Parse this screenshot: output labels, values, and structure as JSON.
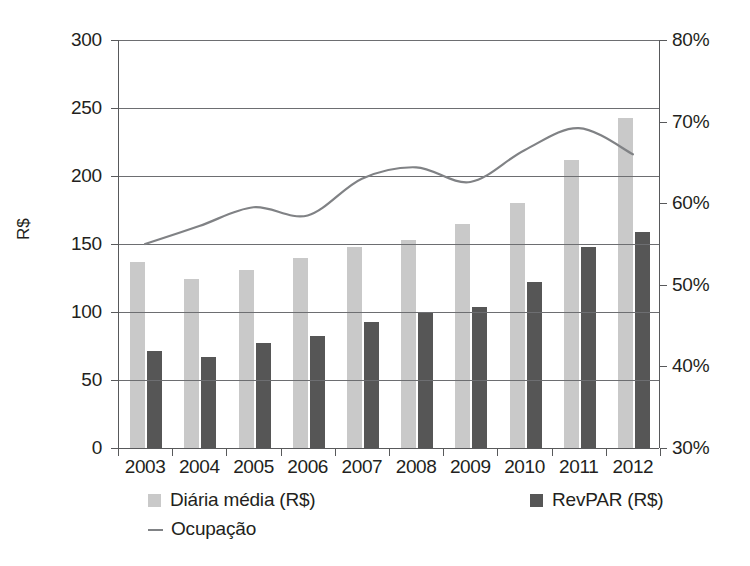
{
  "chart_data": {
    "type": "bar",
    "title": "",
    "subtitle": "",
    "xlabel": "",
    "ylabel": "R$",
    "ylabel_secondary": "",
    "categories": [
      "2003",
      "2004",
      "2005",
      "2006",
      "2007",
      "2008",
      "2009",
      "2010",
      "2011",
      "2012"
    ],
    "series": [
      {
        "name": "Diária média (R$)",
        "type": "bar",
        "axis": "left",
        "color": "#c9c9c9",
        "values": [
          137,
          124,
          131,
          140,
          148,
          153,
          165,
          180,
          212,
          243
        ]
      },
      {
        "name": "RevPAR (R$)",
        "type": "bar",
        "axis": "left",
        "color": "#565656",
        "values": [
          71,
          67,
          77,
          82,
          93,
          100,
          104,
          122,
          148,
          159
        ]
      },
      {
        "name": "Ocupação",
        "type": "line",
        "axis": "right",
        "color": "#808285",
        "values": [
          55.0,
          57.2,
          59.5,
          58.5,
          63.0,
          64.4,
          62.6,
          66.5,
          69.2,
          66.0
        ]
      }
    ],
    "ylim": [
      0,
      300
    ],
    "yticks": [
      0,
      50,
      100,
      150,
      200,
      250,
      300
    ],
    "ylim_secondary": [
      30,
      80
    ],
    "yticks_secondary": [
      30,
      40,
      50,
      60,
      70,
      80
    ],
    "grid": true,
    "legend_position": "bottom"
  },
  "axes": {
    "left_label": "R$",
    "left_ticks": [
      "0",
      "50",
      "100",
      "150",
      "200",
      "250",
      "300"
    ],
    "right_ticks": [
      "30%",
      "40%",
      "50%",
      "60%",
      "70%",
      "80%"
    ],
    "x_ticks": [
      "2003",
      "2004",
      "2005",
      "2006",
      "2007",
      "2008",
      "2009",
      "2010",
      "2011",
      "2012"
    ]
  },
  "legend": {
    "items": [
      {
        "label": "Diária média (R$)",
        "marker": "square-swatch",
        "color": "#c9c9c9"
      },
      {
        "label": "RevPAR (R$)",
        "marker": "square-swatch",
        "color": "#565656"
      },
      {
        "label": "Ocupação",
        "marker": "line-swatch",
        "color": "#808285"
      }
    ]
  },
  "colors": {
    "series1": "#c9c9c9",
    "series2": "#565656",
    "line": "#808285",
    "axis": "#58595b",
    "grid": "#6d6e71",
    "text": "#231f20",
    "background": "#ffffff"
  }
}
